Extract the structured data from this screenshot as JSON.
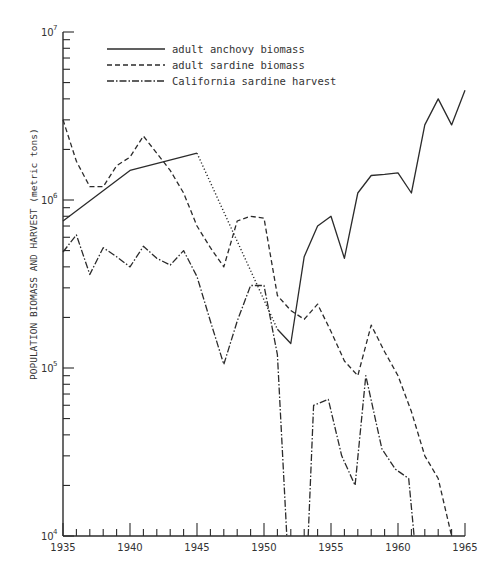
{
  "chart_data": {
    "type": "line",
    "title": "",
    "xlabel": "",
    "ylabel": "POPULATION BIOMASS AND HARVEST (metric tons)",
    "yscale": "log",
    "xlim": [
      1935,
      1965
    ],
    "ylim": [
      10000,
      10000000
    ],
    "x_tick_labels": [
      "1935",
      "1940",
      "1945",
      "1950",
      "1955",
      "1960",
      "1965"
    ],
    "y_tick_labels": [
      {
        "base": "10",
        "exp": "7",
        "value": 10000000
      },
      {
        "base": "10",
        "exp": "6",
        "value": 1000000
      },
      {
        "base": "10",
        "exp": "5",
        "value": 100000
      },
      {
        "base": "10",
        "exp": "4",
        "value": 10000
      }
    ],
    "grid": false,
    "legend_position": "upper-left-inside",
    "series": [
      {
        "name": "adult anchovy biomass",
        "style": "solid",
        "points": [
          [
            1935,
            750000
          ],
          [
            1940,
            1500000
          ],
          [
            1945,
            1900000
          ]
        ],
        "interpolated_dotted": [
          [
            1945,
            1900000
          ],
          [
            1951,
            170000
          ]
        ],
        "points_late": [
          [
            1951,
            170000
          ],
          [
            1952,
            140000
          ],
          [
            1953,
            460000
          ],
          [
            1954,
            700000
          ],
          [
            1955,
            800000
          ],
          [
            1956,
            450000
          ],
          [
            1957,
            1100000
          ],
          [
            1958,
            1400000
          ],
          [
            1959,
            1420000
          ],
          [
            1960,
            1450000
          ],
          [
            1961,
            1100000
          ],
          [
            1962,
            2800000
          ],
          [
            1963,
            4000000
          ],
          [
            1964,
            2800000
          ],
          [
            1965,
            4500000
          ]
        ]
      },
      {
        "name": "adult sardine biomass",
        "style": "dashed",
        "points": [
          [
            1935,
            3000000
          ],
          [
            1936,
            1700000
          ],
          [
            1937,
            1200000
          ],
          [
            1938,
            1200000
          ],
          [
            1939,
            1600000
          ],
          [
            1940,
            1800000
          ],
          [
            1941,
            2400000
          ],
          [
            1942,
            1900000
          ],
          [
            1943,
            1500000
          ],
          [
            1944,
            1100000
          ],
          [
            1945,
            700000
          ],
          [
            1946,
            520000
          ],
          [
            1947,
            400000
          ],
          [
            1948,
            750000
          ],
          [
            1949,
            800000
          ],
          [
            1950,
            780000
          ],
          [
            1951,
            270000
          ],
          [
            1952,
            220000
          ],
          [
            1953,
            195000
          ],
          [
            1954,
            240000
          ],
          [
            1955,
            165000
          ],
          [
            1956,
            110000
          ],
          [
            1957,
            90000
          ],
          [
            1958,
            180000
          ],
          [
            1959,
            125000
          ],
          [
            1960,
            90000
          ],
          [
            1961,
            55000
          ],
          [
            1962,
            30000
          ],
          [
            1963,
            22000
          ],
          [
            1964,
            10000
          ]
        ]
      },
      {
        "name": "California sardine harvest",
        "style": "dash-dot",
        "segments": [
          [
            [
              1935,
              490000
            ],
            [
              1936,
              620000
            ],
            [
              1937,
              360000
            ],
            [
              1938,
              520000
            ],
            [
              1939,
              460000
            ],
            [
              1940,
              400000
            ],
            [
              1941,
              530000
            ],
            [
              1942,
              450000
            ],
            [
              1943,
              410000
            ],
            [
              1944,
              500000
            ],
            [
              1945,
              350000
            ],
            [
              1946,
              190000
            ],
            [
              1947,
              105000
            ],
            [
              1948,
              190000
            ],
            [
              1949,
              310000
            ],
            [
              1950,
              310000
            ],
            [
              1951,
              120000
            ],
            [
              1951.7,
              10000
            ]
          ],
          [
            [
              1953.3,
              10000
            ],
            [
              1953.7,
              60000
            ],
            [
              1954.8,
              65000
            ],
            [
              1955.8,
              30000
            ],
            [
              1956.8,
              20000
            ],
            [
              1957.6,
              90000
            ],
            [
              1958.8,
              33000
            ],
            [
              1959.8,
              25000
            ],
            [
              1960.8,
              22000
            ],
            [
              1961.2,
              10000
            ]
          ]
        ]
      }
    ]
  },
  "legend": {
    "items": [
      {
        "label": "adult anchovy biomass",
        "style": "solid"
      },
      {
        "label": "adult sardine biomass",
        "style": "dashed"
      },
      {
        "label": "California sardine harvest",
        "style": "dash-dot"
      }
    ]
  },
  "colors": {
    "line": "#2b2b2b",
    "background": "#ffffff"
  }
}
